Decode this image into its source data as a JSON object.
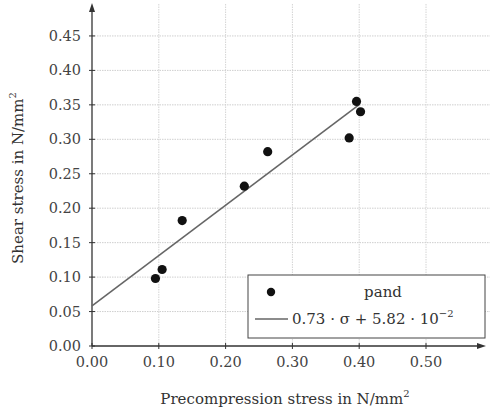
{
  "chart_data": {
    "type": "scatter",
    "title": "",
    "xlabel": "Precompression stress in N/mm",
    "xlabel_sup": "2",
    "ylabel": "Shear stress in N/mm",
    "ylabel_sup": "2",
    "xlim": [
      0.0,
      0.59
    ],
    "ylim": [
      0.0,
      0.5
    ],
    "grid": true,
    "legend_position": "lower right",
    "x_ticks": [
      "0.00",
      "0.10",
      "0.20",
      "0.30",
      "0.40",
      "0.50"
    ],
    "x_tick_values": [
      0.0,
      0.1,
      0.2,
      0.3,
      0.4,
      0.5
    ],
    "y_ticks": [
      "0.00",
      "0.05",
      "0.10",
      "0.15",
      "0.20",
      "0.25",
      "0.30",
      "0.35",
      "0.40",
      "0.45"
    ],
    "y_tick_values": [
      0.0,
      0.05,
      0.1,
      0.15,
      0.2,
      0.25,
      0.3,
      0.35,
      0.4,
      0.45
    ],
    "series": [
      {
        "name": "pand",
        "type": "scatter",
        "marker": "filled-circle",
        "color": "#111111",
        "points": [
          {
            "x": 0.095,
            "y": 0.098
          },
          {
            "x": 0.105,
            "y": 0.111
          },
          {
            "x": 0.135,
            "y": 0.182
          },
          {
            "x": 0.228,
            "y": 0.232
          },
          {
            "x": 0.263,
            "y": 0.282
          },
          {
            "x": 0.385,
            "y": 0.302
          },
          {
            "x": 0.396,
            "y": 0.355
          },
          {
            "x": 0.402,
            "y": 0.34
          }
        ]
      },
      {
        "name": "0.73 · σ + 5.82 · 10^-2",
        "type": "line",
        "color": "#666666",
        "slope": 0.73,
        "intercept": 0.0582,
        "x_range": [
          0.0,
          0.4
        ]
      }
    ]
  },
  "legend": {
    "entries": [
      {
        "label": "pand"
      },
      {
        "label_main": "0.73 · σ + 5.82 · 10",
        "label_sup": "−2"
      }
    ]
  }
}
